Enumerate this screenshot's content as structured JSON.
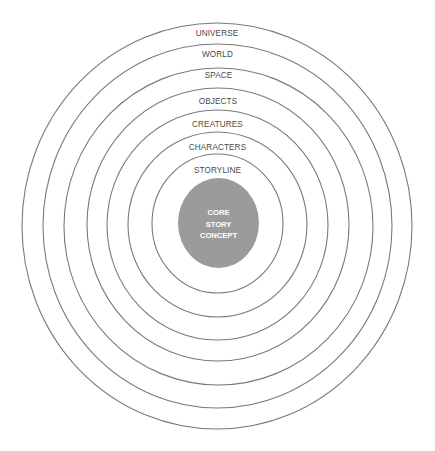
{
  "diagram": {
    "colors": {
      "ring_stroke": "#7a7a7a",
      "core_fill": "#9b9b9b",
      "label_text": "#4a4a4a",
      "core_text": "#ffffff",
      "background": "#ffffff"
    },
    "rings": [
      {
        "label": "UNIVERSE",
        "cx": 217,
        "cy": 226,
        "rx": 195,
        "ry": 203,
        "label_y": 34
      },
      {
        "label": "WORLD",
        "cx": 217.5,
        "cy": 226,
        "rx": 174.5,
        "ry": 182,
        "label_y": 55
      },
      {
        "label": "SPACE",
        "cx": 218.5,
        "cy": 226.5,
        "rx": 154.5,
        "ry": 158.5,
        "label_y": 76
      },
      {
        "label": "OBJECTS",
        "cx": 218,
        "cy": 224.5,
        "rx": 131,
        "ry": 136.5,
        "label_y": 102
      },
      {
        "label": "CREATURES",
        "cx": 217.5,
        "cy": 225,
        "rx": 110.5,
        "ry": 115,
        "label_y": 125
      },
      {
        "label": "CHARACTERS",
        "cx": 217.5,
        "cy": 224.5,
        "rx": 89.5,
        "ry": 92.5,
        "label_y": 148
      },
      {
        "label": "STORYLINE",
        "cx": 217.5,
        "cy": 223.5,
        "rx": 65.5,
        "ry": 69.5,
        "label_y": 171
      }
    ],
    "core": {
      "lines": [
        "CORE",
        "STORY",
        "CONCEPT"
      ],
      "cx": 218.5,
      "cy": 223,
      "rx": 40.5,
      "ry": 45,
      "line_y": [
        213,
        224.5,
        236
      ]
    }
  }
}
